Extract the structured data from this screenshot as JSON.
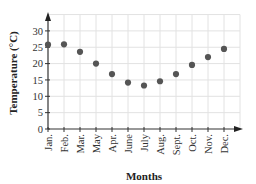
{
  "chart_data": {
    "type": "scatter",
    "title": "",
    "xlabel": "Months",
    "ylabel": "Temperature (°C)",
    "categories": [
      "Jan.",
      "Feb.",
      "Mar.",
      "May",
      "Apr.",
      "June",
      "July",
      "Aug.",
      "Sept.",
      "Oct.",
      "Nov.",
      "Dec."
    ],
    "values": [
      25.8,
      25.9,
      23.6,
      20,
      16.8,
      14.2,
      13.3,
      14.6,
      16.8,
      19.6,
      22,
      24.5
    ],
    "series": [
      {
        "name": "Temperature",
        "values": [
          25.8,
          25.9,
          23.6,
          20,
          16.8,
          14.2,
          13.3,
          14.6,
          16.8,
          19.6,
          22,
          24.5
        ]
      }
    ],
    "ylim": [
      0,
      35
    ],
    "yticks": [
      0,
      5,
      10,
      15,
      20,
      25,
      30
    ],
    "grid": true,
    "legend": "none",
    "marker_color": "#555555",
    "grid_color": "#e2e2e2",
    "axis_color": "#333333"
  }
}
